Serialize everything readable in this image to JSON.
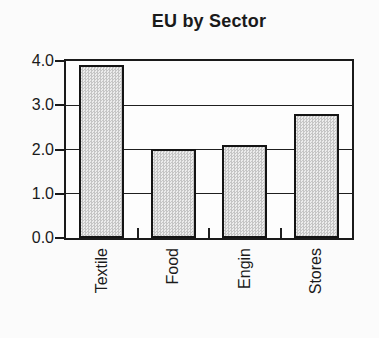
{
  "chart_data": {
    "type": "bar",
    "title": "EU by Sector",
    "categories": [
      "Textile",
      "Food",
      "Engin",
      "Stores"
    ],
    "values": [
      3.9,
      2.0,
      2.1,
      2.8
    ],
    "xlabel": "",
    "ylabel": "",
    "ylim": [
      0,
      4
    ],
    "yticks": [
      0.0,
      1.0,
      2.0,
      3.0,
      4.0
    ],
    "ytick_labels": [
      "0.0",
      "1.0",
      "2.0",
      "3.0",
      "4.0"
    ],
    "gridlines": [
      1.0,
      2.0,
      3.0
    ],
    "grid": "horizontal",
    "legend": "none",
    "bar_fill": "#d9d9d9",
    "bar_border": "#141414",
    "frame_color": "#1a1a1a",
    "background": "#fbfbfb"
  }
}
